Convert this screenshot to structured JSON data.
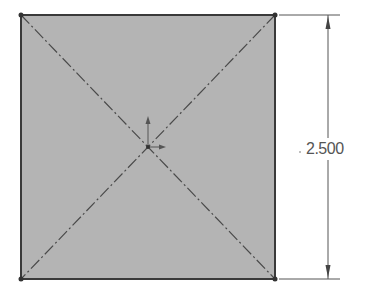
{
  "sketch": {
    "shape": "square",
    "fill_color": "#b4b4b4",
    "edge_color": "#3a3a3a",
    "construction_lines": "diagonal centerlines",
    "origin_marker": "origin-axes"
  },
  "dimension": {
    "orientation": "vertical",
    "value": "2.500"
  }
}
